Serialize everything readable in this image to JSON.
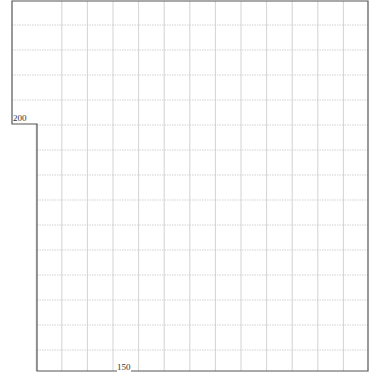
{
  "sheet": {
    "labels": {
      "left_dimension": "200",
      "bottom_dimension": "150"
    },
    "colors": {
      "outline": "#555555",
      "grid": "#c8c8c8",
      "background": "#ffffff"
    }
  }
}
